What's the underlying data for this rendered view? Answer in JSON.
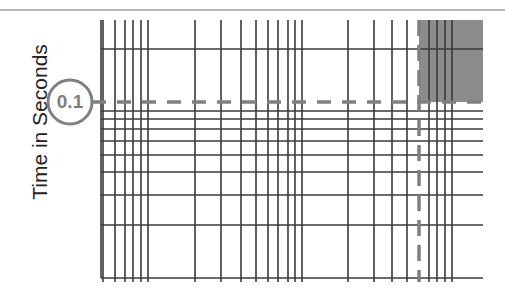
{
  "figure": {
    "y_axis_label": "Time in Seconds",
    "highlight_value_label": "0.1",
    "colors": {
      "grid": "#3a3a3a",
      "highlight": "#808080",
      "shaded_region": "#8c8c8c",
      "top_rule": "#b8b8b8"
    }
  },
  "chart_data": {
    "type": "grid-diagram",
    "title": "",
    "xlabel": "",
    "ylabel": "Time in Seconds",
    "grid": true,
    "plot_area_px": {
      "left": 101,
      "top": 20,
      "right": 483,
      "bottom": 278
    },
    "vertical_lines_x_px": [
      103,
      115,
      125,
      133,
      141,
      148,
      195,
      221,
      241,
      256,
      268,
      278,
      288,
      295,
      302,
      348,
      374,
      392,
      407,
      429,
      437,
      445,
      452
    ],
    "horizontal_lines_y_px": [
      49,
      111,
      119,
      129,
      141,
      155,
      172,
      195,
      225,
      278
    ],
    "annotations": [
      {
        "type": "circle-label",
        "text": "0.1",
        "center_px": [
          70,
          102
        ],
        "radius_px": 22
      },
      {
        "type": "dashed-horizontal",
        "y_px": 102,
        "x_from_px": 92,
        "x_to_px": 483,
        "represents": "0.1 seconds threshold"
      },
      {
        "type": "dashed-vertical",
        "x_px": 419,
        "y_from_px": 20,
        "y_to_px": 280
      },
      {
        "type": "shaded-rectangle",
        "x_px": [
          419,
          483
        ],
        "y_px": [
          20,
          102
        ]
      }
    ]
  }
}
